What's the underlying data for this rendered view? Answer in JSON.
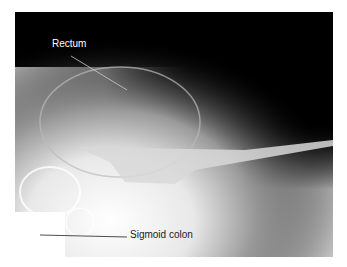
{
  "figure": {
    "type": "radiograph",
    "labels": {
      "rectum": "Rectum",
      "sigmoid": "Sigmoid colon"
    }
  }
}
